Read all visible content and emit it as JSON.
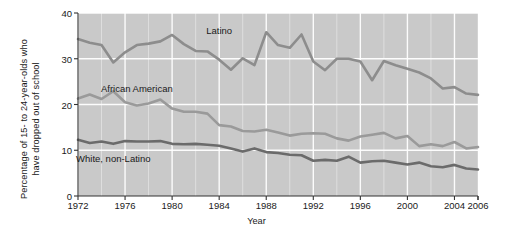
{
  "chart_data": {
    "type": "line",
    "title": "",
    "xlabel": "Year",
    "ylabel": "Percentage of 15- to 24-year-olds who\nhave dropped out of school",
    "xlim": [
      1972,
      2006
    ],
    "ylim": [
      0,
      40
    ],
    "yticks": [
      0,
      10,
      20,
      30,
      40
    ],
    "ytick_labels": [
      "0",
      "10",
      "20",
      "30",
      "40"
    ],
    "xticks": [
      1972,
      1976,
      1980,
      1984,
      1988,
      1992,
      1996,
      2000,
      2004,
      2006
    ],
    "xtick_labels": [
      "1972",
      "1976",
      "1980",
      "1984",
      "1988",
      "1992",
      "1996",
      "2000",
      "2004",
      "2006"
    ],
    "grid": true,
    "grid_color": "#ffffff",
    "plot_background": "#c9c9c9",
    "legend": "inline-labels",
    "x": [
      1972,
      1973,
      1974,
      1975,
      1976,
      1977,
      1978,
      1979,
      1980,
      1981,
      1982,
      1983,
      1984,
      1985,
      1986,
      1987,
      1988,
      1989,
      1990,
      1991,
      1992,
      1993,
      1994,
      1995,
      1996,
      1997,
      1998,
      1999,
      2000,
      2001,
      2002,
      2003,
      2004,
      2005,
      2006
    ],
    "series": [
      {
        "name": "Latino",
        "color": "#8d8d8d",
        "values": [
          34.3,
          33.5,
          33.0,
          29.2,
          31.4,
          33.0,
          33.3,
          33.8,
          35.2,
          33.2,
          31.7,
          31.6,
          29.8,
          27.6,
          30.1,
          28.6,
          35.8,
          33.0,
          32.4,
          35.3,
          29.4,
          27.5,
          30.0,
          30.0,
          29.4,
          25.3,
          29.5,
          28.6,
          27.8,
          27.0,
          25.7,
          23.5,
          23.8,
          22.4,
          22.1
        ]
      },
      {
        "name": "African American",
        "color": "#9a9a9a",
        "values": [
          21.3,
          22.2,
          21.2,
          22.9,
          20.5,
          19.8,
          20.2,
          21.1,
          19.1,
          18.4,
          18.4,
          18.0,
          15.5,
          15.2,
          14.2,
          14.1,
          14.5,
          13.9,
          13.2,
          13.6,
          13.7,
          13.6,
          12.6,
          12.1,
          13.0,
          13.4,
          13.8,
          12.6,
          13.1,
          10.9,
          11.3,
          10.9,
          11.8,
          10.4,
          10.7
        ]
      },
      {
        "name": "White, non-Latino",
        "color": "#6b6b6b",
        "values": [
          12.3,
          11.6,
          11.9,
          11.4,
          12.0,
          11.9,
          11.9,
          12.0,
          11.4,
          11.3,
          11.4,
          11.2,
          11.0,
          10.4,
          9.7,
          10.4,
          9.6,
          9.4,
          9.0,
          8.9,
          7.7,
          7.9,
          7.7,
          8.6,
          7.3,
          7.6,
          7.7,
          7.3,
          6.9,
          7.3,
          6.5,
          6.3,
          6.8,
          6.0,
          5.8
        ]
      }
    ],
    "annotations": [
      {
        "text": "Latino",
        "x": 1984,
        "y": 36.2
      },
      {
        "text": "African American",
        "x": 1977,
        "y": 23.6
      },
      {
        "text": "White, non-Latino",
        "x": 1975,
        "y": 8.2
      }
    ]
  }
}
